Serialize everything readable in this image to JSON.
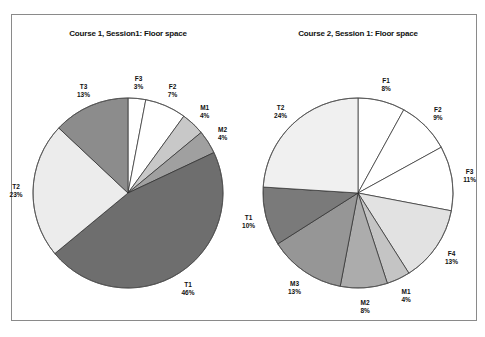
{
  "chart_data": [
    {
      "type": "pie",
      "title": "Course 1, Session1: Floor space",
      "categories": [
        "F3",
        "F2",
        "M1",
        "M2",
        "T1",
        "T2",
        "T3"
      ],
      "values": [
        3,
        7,
        4,
        4,
        46,
        23,
        13
      ],
      "labels": [
        "3%",
        "7%",
        "4%",
        "4%",
        "46%",
        "23%",
        "13%"
      ],
      "colors": [
        "#ffffff",
        "#ffffff",
        "#c8c8c8",
        "#a0a0a0",
        "#6e6e6e",
        "#ececec",
        "#8c8c8c"
      ],
      "start_angle": "12 o'clock, clockwise",
      "legend": "none (inline labels)"
    },
    {
      "type": "pie",
      "title": "Course 2, Session 1: Floor space",
      "categories": [
        "F1",
        "F2",
        "F3",
        "F4",
        "M1",
        "M2",
        "M3",
        "T1",
        "T2"
      ],
      "values": [
        8,
        9,
        11,
        13,
        4,
        8,
        13,
        10,
        24
      ],
      "labels": [
        "8%",
        "9%",
        "11%",
        "13%",
        "4%",
        "8%",
        "13%",
        "10%",
        "24%"
      ],
      "colors": [
        "#ffffff",
        "#ffffff",
        "#ffffff",
        "#e2e2e2",
        "#c4c4c4",
        "#acacac",
        "#969696",
        "#7a7a7a",
        "#f0f0f0"
      ],
      "start_angle": "12 o'clock, clockwise",
      "legend": "none (inline labels)"
    }
  ]
}
